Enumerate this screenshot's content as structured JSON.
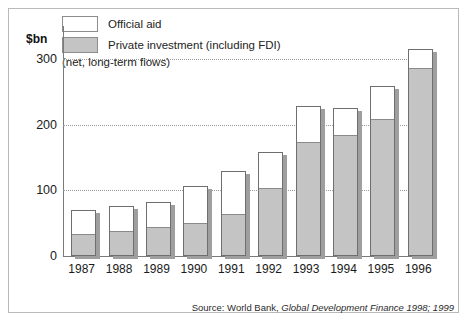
{
  "unit_label": "$bn",
  "legend": {
    "items": [
      {
        "label": "Official aid",
        "swatch": "white-swatch",
        "color": "#ffffff"
      },
      {
        "label": "Private investment (including FDI)",
        "swatch": "gray-swatch",
        "color": "#c4c4c4"
      }
    ],
    "note": "(net, long-term flows)"
  },
  "source": {
    "prefix": "Source: World Bank, ",
    "title": "Global Development Finance 1998; 1999"
  },
  "chart_data": {
    "type": "bar",
    "title": "",
    "subtitle": "",
    "xlabel": "",
    "ylabel": "$bn",
    "ylim": [
      0,
      350
    ],
    "yticks": [
      0,
      100,
      200,
      300
    ],
    "ytick_labels": [
      "0",
      "100",
      "200",
      "300"
    ],
    "grid": true,
    "grid_style": "dotted",
    "grid_axis": "y",
    "stacked": true,
    "legend_position": "top-left",
    "categories": [
      "1987",
      "1988",
      "1989",
      "1990",
      "1991",
      "1992",
      "1993",
      "1994",
      "1995",
      "1996"
    ],
    "series": [
      {
        "name": "Private investment (including FDI)",
        "color": "#c4c4c4",
        "values": [
          32,
          37,
          43,
          49,
          63,
          102,
          172,
          183,
          207,
          285
        ]
      },
      {
        "name": "Official aid",
        "color": "#ffffff",
        "values": [
          38,
          39,
          39,
          58,
          67,
          56,
          56,
          43,
          51,
          30
        ]
      }
    ],
    "totals": [
      70,
      76,
      82,
      107,
      130,
      158,
      228,
      226,
      258,
      315
    ],
    "annotations": [
      "(net, long-term flows)"
    ]
  }
}
